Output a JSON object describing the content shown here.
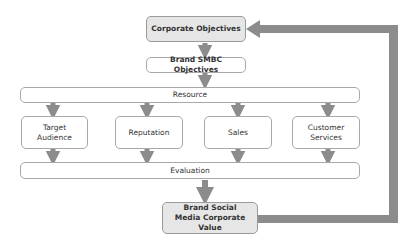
{
  "diagram": {
    "nodes": {
      "corporate_objectives": "Corporate Objectives",
      "brand_smbc_objectives": "Brand SMBC Objectives",
      "resource": "Resource",
      "target_audience": "Target Audience",
      "reputation": "Reputation",
      "sales": "Sales",
      "customer_services": "Customer Services",
      "evaluation": "Evaluation",
      "brand_social_media_value": "Brand Social Media Corporate Value"
    },
    "edges": [
      [
        "corporate_objectives",
        "brand_smbc_objectives"
      ],
      [
        "brand_smbc_objectives",
        "resource"
      ],
      [
        "resource",
        "target_audience"
      ],
      [
        "resource",
        "reputation"
      ],
      [
        "resource",
        "sales"
      ],
      [
        "resource",
        "customer_services"
      ],
      [
        "target_audience",
        "evaluation"
      ],
      [
        "reputation",
        "evaluation"
      ],
      [
        "sales",
        "evaluation"
      ],
      [
        "customer_services",
        "evaluation"
      ],
      [
        "evaluation",
        "brand_social_media_value"
      ],
      [
        "brand_social_media_value",
        "corporate_objectives"
      ]
    ],
    "colors": {
      "arrow": "#8c8c8c",
      "box_border": "#a8a8a8",
      "shaded_fill": "#e6e6e6"
    }
  }
}
